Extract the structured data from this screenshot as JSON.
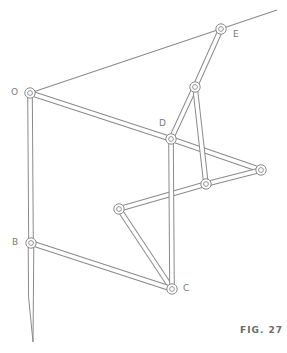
{
  "figure": {
    "caption": "FIG. 27",
    "stroke_color": "#8a8a8a",
    "background": "#ffffff"
  },
  "joints": {
    "O": {
      "label": "O",
      "x": 30,
      "y": 93,
      "label_x": 11,
      "label_y": 88
    },
    "E": {
      "label": "E",
      "x": 221,
      "y": 29,
      "label_x": 233,
      "label_y": 30
    },
    "F": {
      "label": "",
      "x": 195,
      "y": 87
    },
    "D": {
      "label": "D",
      "x": 171,
      "y": 139,
      "label_x": 159,
      "label_y": 119
    },
    "G": {
      "label": "",
      "x": 261,
      "y": 170
    },
    "H": {
      "label": "",
      "x": 206,
      "y": 184
    },
    "I": {
      "label": "",
      "x": 119,
      "y": 209
    },
    "B": {
      "label": "B",
      "x": 31,
      "y": 243,
      "label_x": 12,
      "label_y": 238
    },
    "C": {
      "label": "C",
      "x": 172,
      "y": 289,
      "label_x": 183,
      "label_y": 284
    }
  },
  "guide_line": {
    "from": "O",
    "to_x": 277,
    "to_y": 10
  },
  "bars": [
    {
      "from": "O",
      "to": "D"
    },
    {
      "from": "D",
      "to": "G"
    },
    {
      "from": "G",
      "to": "H"
    },
    {
      "from": "H",
      "to": "I"
    },
    {
      "from": "I",
      "to": "C"
    },
    {
      "from": "B",
      "to": "C"
    },
    {
      "from": "O",
      "to": "B"
    },
    {
      "from": "D",
      "to": "C"
    },
    {
      "from": "D",
      "to": "F"
    },
    {
      "from": "F",
      "to": "E"
    },
    {
      "from": "F",
      "to": "H"
    }
  ],
  "stylus": {
    "from": "B",
    "tip_x": 33,
    "tip_y": 342
  },
  "labels": {
    "O": "O",
    "E": "E",
    "D": "D",
    "B": "B",
    "C": "C"
  }
}
